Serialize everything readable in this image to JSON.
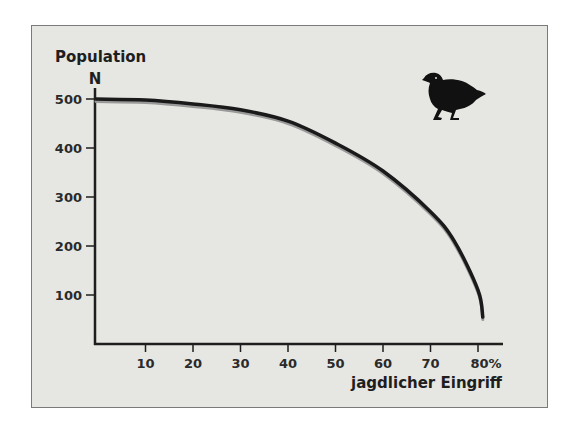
{
  "chart_data": {
    "type": "line",
    "title": "",
    "ylabel": "Population",
    "ylabel_symbol": "N",
    "xlabel": "jagdlicher Eingriff",
    "x_unit": "%",
    "xlim": [
      0,
      85
    ],
    "ylim": [
      0,
      520
    ],
    "grid": false,
    "legend": null,
    "x_ticks": [
      10,
      20,
      30,
      40,
      50,
      60,
      70,
      80
    ],
    "x_tick_labels": [
      "10",
      "20",
      "30",
      "40",
      "50",
      "60",
      "70",
      "80%"
    ],
    "y_ticks": [
      100,
      200,
      300,
      400,
      500
    ],
    "y_tick_labels": [
      "100",
      "200",
      "300",
      "400",
      "500"
    ],
    "series": [
      {
        "name": "Population N",
        "color": "#1a1a1a",
        "x": [
          0,
          10,
          20,
          30,
          40,
          50,
          60,
          70,
          75,
          80,
          81
        ],
        "values": [
          500,
          498,
          490,
          478,
          455,
          410,
          353,
          270,
          210,
          110,
          55
        ]
      }
    ],
    "annotations": [
      {
        "type": "icon",
        "name": "quail-bird-silhouette",
        "position": "top-right"
      }
    ]
  },
  "labels": {
    "y_title": "Population",
    "y_symbol": "N",
    "x_title": "jagdlicher Eingriff"
  },
  "colors": {
    "background": "#e6e6e2",
    "frame_border": "#7a7a7a",
    "axis": "#1e1e1e",
    "curve": "#1a1a1a",
    "curve_shadow": "#9a9a9a",
    "bird": "#111111"
  }
}
